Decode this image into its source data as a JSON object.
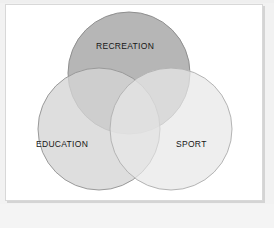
{
  "diagram": {
    "type": "venn",
    "title": "",
    "background_color": "#ffffff",
    "page_background_color": "#f2f2f2",
    "border_color": "#d8d8d8",
    "stroke_color": "#9a9a9a",
    "label_color": "#161616",
    "sets": [
      {
        "id": "recreation",
        "label": "RECREATION",
        "fill": "#b0b0b0",
        "cx": 124,
        "cy": 69,
        "r": 61,
        "label_x": 96,
        "label_y": 41
      },
      {
        "id": "education",
        "label": "EDUCATION",
        "fill": "#d5d5d5",
        "cx": 94,
        "cy": 125,
        "r": 61,
        "label_x": 36,
        "label_y": 139
      },
      {
        "id": "sport",
        "label": "SPORT",
        "fill": "#e6e6e6",
        "cx": 166,
        "cy": 125,
        "r": 61,
        "label_x": 176,
        "label_y": 139
      }
    ]
  }
}
